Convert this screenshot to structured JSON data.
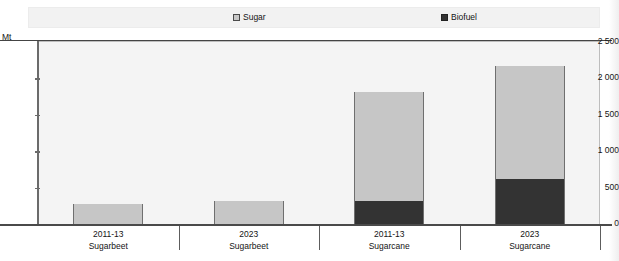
{
  "chart_data": {
    "type": "bar",
    "title": "",
    "xlabel": "",
    "ylabel": "Mt",
    "unit": "Mt",
    "stacked": true,
    "grid": false,
    "legend_position": "top",
    "ylim": [
      0,
      2500
    ],
    "yticks": [
      0,
      500,
      1000,
      1500,
      2000,
      2500
    ],
    "ytick_labels": [
      "0",
      "500",
      "1 000",
      "1 500",
      "2 000",
      "2 500"
    ],
    "categories": [
      {
        "period": "2011-13",
        "crop": "Sugarbeet"
      },
      {
        "period": "2023",
        "crop": "Sugarbeet"
      },
      {
        "period": "2011-13",
        "crop": "Sugarcane"
      },
      {
        "period": "2023",
        "crop": "Sugarcane"
      }
    ],
    "category_labels": [
      "2011-13 Sugarbeet",
      "2023 Sugarbeet",
      "2011-13 Sugarcane",
      "2023 Sugarcane"
    ],
    "series": [
      {
        "name": "Sugar",
        "color": "#c6c6c6",
        "values": [
          270,
          310,
          1490,
          1545
        ]
      },
      {
        "name": "Biofuel",
        "color": "#333333",
        "values": [
          0,
          0,
          320,
          625
        ]
      }
    ],
    "totals": [
      270,
      310,
      1810,
      2170
    ]
  },
  "legend": {
    "items": [
      {
        "label": "Sugar",
        "icon": "square-outline-swatch",
        "color": "#c6c6c6"
      },
      {
        "label": "Biofuel",
        "icon": "square-filled-swatch",
        "color": "#333333"
      }
    ]
  },
  "axis": {
    "unit_label": "Mt",
    "y_tick_labels": [
      "2 500",
      "2 000",
      "1 500",
      "1 000",
      "500",
      "0"
    ]
  }
}
